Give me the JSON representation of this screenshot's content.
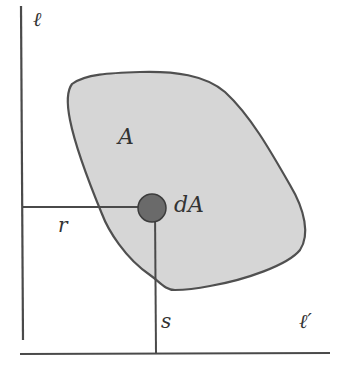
{
  "diagram": {
    "labels": {
      "axis_vertical": "ℓ",
      "axis_horizontal": "ℓ′",
      "region": "A",
      "element": "dA",
      "distance_to_vertical": "r",
      "distance_to_horizontal": "s"
    },
    "colors": {
      "line": "#4a4a4a",
      "region_fill": "#d6d6d6",
      "region_stroke": "#505050",
      "element_fill": "#6a6a6a",
      "element_stroke": "#3c3c3c",
      "text": "#333333"
    }
  }
}
